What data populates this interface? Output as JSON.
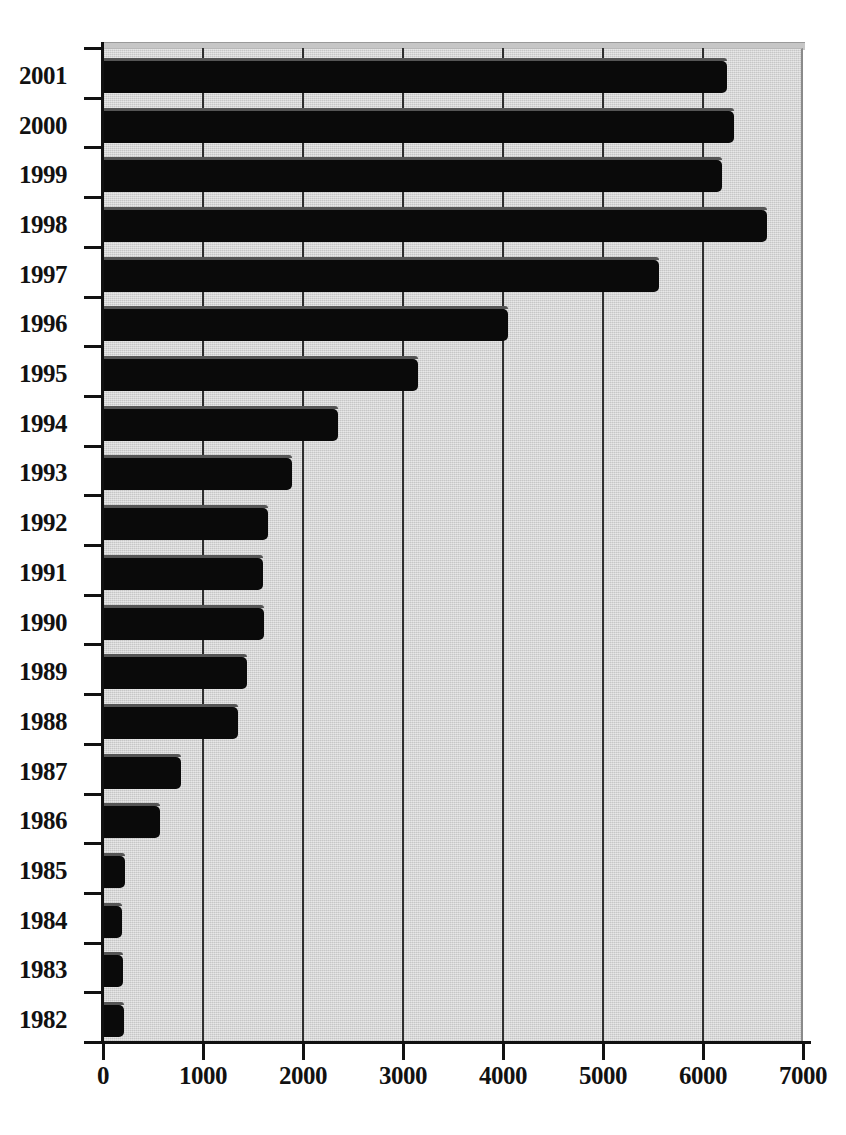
{
  "chart_data": {
    "type": "bar",
    "orientation": "horizontal",
    "title": "",
    "xlabel": "",
    "ylabel": "",
    "xlim": [
      0,
      7000
    ],
    "ylim": null,
    "grid": true,
    "legend": null,
    "xticks": [
      0,
      1000,
      2000,
      3000,
      4000,
      5000,
      6000,
      7000
    ],
    "xtick_labels": [
      "0",
      "1000",
      "2000",
      "3000",
      "4000",
      "5000",
      "6000",
      "7000"
    ],
    "categories": [
      "2001",
      "2000",
      "1999",
      "1998",
      "1997",
      "1996",
      "1995",
      "1994",
      "1993",
      "1992",
      "1991",
      "1990",
      "1989",
      "1988",
      "1987",
      "1986",
      "1985",
      "1984",
      "1983",
      "1982"
    ],
    "values": [
      6240,
      6310,
      6190,
      6640,
      5560,
      4050,
      3150,
      2350,
      1890,
      1650,
      1600,
      1610,
      1440,
      1350,
      775,
      570,
      220,
      190,
      200,
      210
    ],
    "bars": [
      {
        "category": "2001",
        "value": 6240
      },
      {
        "category": "2000",
        "value": 6310
      },
      {
        "category": "1999",
        "value": 6190
      },
      {
        "category": "1998",
        "value": 6640
      },
      {
        "category": "1997",
        "value": 5560
      },
      {
        "category": "1996",
        "value": 4050
      },
      {
        "category": "1995",
        "value": 3150
      },
      {
        "category": "1994",
        "value": 2350
      },
      {
        "category": "1993",
        "value": 1890
      },
      {
        "category": "1992",
        "value": 1650
      },
      {
        "category": "1991",
        "value": 1600
      },
      {
        "category": "1990",
        "value": 1610
      },
      {
        "category": "1989",
        "value": 1440
      },
      {
        "category": "1988",
        "value": 1350
      },
      {
        "category": "1987",
        "value": 775
      },
      {
        "category": "1986",
        "value": 570
      },
      {
        "category": "1985",
        "value": 220
      },
      {
        "category": "1984",
        "value": 190
      },
      {
        "category": "1983",
        "value": 200
      },
      {
        "category": "1982",
        "value": 210
      }
    ]
  },
  "colors": {
    "bar": "#0a0a0a",
    "panel": "#d4d4d4",
    "gridline": "#2e2e2e",
    "axis": "#111111",
    "background": "#ffffff"
  },
  "geometry": {
    "plot_left": 103,
    "plot_top": 48,
    "plot_width": 700,
    "plot_height": 994,
    "px_per_unit": 0.1,
    "row_height": 49.7,
    "bar_height": 32
  }
}
